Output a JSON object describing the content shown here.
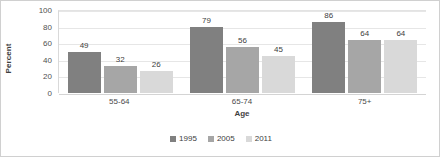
{
  "chart_data": {
    "type": "bar",
    "title": "",
    "subtitle": "",
    "xlabel": "Age",
    "ylabel": "Percent",
    "categories": [
      "55-64",
      "65-74",
      "75+"
    ],
    "series": [
      {
        "name": "1995",
        "color": "#808080",
        "values": [
          49,
          79,
          86
        ]
      },
      {
        "name": "2005",
        "color": "#a6a6a6",
        "values": [
          32,
          56,
          64
        ]
      },
      {
        "name": "2011",
        "color": "#d9d9d9",
        "values": [
          26,
          45,
          64
        ]
      }
    ],
    "ylim": [
      0,
      100
    ],
    "ytick_step": 20,
    "yticks": [
      100,
      80,
      60,
      40,
      20,
      0
    ],
    "grid": "horizontal",
    "legend_position": "bottom-center",
    "data_labels": true,
    "annotations": []
  },
  "axes": {
    "y_title": "Percent",
    "x_title": "Age"
  },
  "colors": {
    "series_1995": "#808080",
    "series_2005": "#a6a6a6",
    "series_2011": "#d9d9d9",
    "gridline": "#e6e6e6",
    "border": "#d0d0d0",
    "text": "#404040"
  }
}
